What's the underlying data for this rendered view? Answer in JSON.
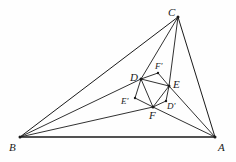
{
  "figure": {
    "background_color": "#fefefe",
    "stroke_color": "#1a1a1a",
    "vertices": {
      "A": {
        "label": "A",
        "x": 215,
        "y": 137,
        "label_x": 218,
        "label_y": 142,
        "size": "major"
      },
      "B": {
        "label": "B",
        "x": 20,
        "y": 137,
        "label_x": 9,
        "label_y": 142,
        "size": "major"
      },
      "C": {
        "label": "C",
        "x": 178,
        "y": 17,
        "label_x": 168,
        "label_y": 7,
        "size": "major"
      },
      "D": {
        "label": "D",
        "x": 141,
        "y": 79,
        "label_x": 130,
        "label_y": 72,
        "size": "major"
      },
      "E": {
        "label": "E",
        "x": 169,
        "y": 86,
        "label_x": 173,
        "label_y": 79,
        "size": "major"
      },
      "F": {
        "label": "F",
        "x": 153,
        "y": 107,
        "label_x": 149,
        "label_y": 110,
        "size": "major"
      },
      "Dp": {
        "label": "D'",
        "x": 166,
        "y": 101,
        "label_x": 167,
        "label_y": 102,
        "size": "minor"
      },
      "Ep": {
        "label": "E'",
        "x": 135,
        "y": 98,
        "label_x": 121,
        "label_y": 97,
        "size": "minor"
      },
      "Fp": {
        "label": "F'",
        "x": 158,
        "y": 73,
        "label_x": 155,
        "label_y": 62,
        "size": "minor"
      }
    },
    "edges": [
      {
        "name": "side-BA",
        "from": "B",
        "to": "A",
        "width": 1.7
      },
      {
        "name": "side-BC",
        "from": "B",
        "to": "C",
        "width": 1.0
      },
      {
        "name": "side-CA",
        "from": "C",
        "to": "A",
        "width": 1.0
      },
      {
        "name": "cevian-B-D",
        "from": "B",
        "to": "D",
        "width": 0.9
      },
      {
        "name": "cevian-B-F",
        "from": "B",
        "to": "F",
        "width": 0.9
      },
      {
        "name": "cevian-A-E",
        "from": "A",
        "to": "E",
        "width": 0.9
      },
      {
        "name": "cevian-A-F",
        "from": "A",
        "to": "F",
        "width": 0.9
      },
      {
        "name": "cevian-C-D",
        "from": "C",
        "to": "D",
        "width": 0.9
      },
      {
        "name": "cevian-C-E",
        "from": "C",
        "to": "E",
        "width": 0.9
      },
      {
        "name": "hexagon-D-Fp",
        "from": "D",
        "to": "Fp",
        "width": 0.9
      },
      {
        "name": "hexagon-Fp-E",
        "from": "Fp",
        "to": "E",
        "width": 0.9
      },
      {
        "name": "hexagon-E-Dp",
        "from": "E",
        "to": "Dp",
        "width": 0.9
      },
      {
        "name": "hexagon-Dp-F",
        "from": "Dp",
        "to": "F",
        "width": 0.9
      },
      {
        "name": "hexagon-F-Ep",
        "from": "F",
        "to": "Ep",
        "width": 0.9
      },
      {
        "name": "hexagon-Ep-D",
        "from": "Ep",
        "to": "D",
        "width": 0.9
      },
      {
        "name": "inner-D-E",
        "from": "D",
        "to": "E",
        "width": 0.9
      },
      {
        "name": "inner-E-F",
        "from": "E",
        "to": "F",
        "width": 0.9
      },
      {
        "name": "inner-F-D",
        "from": "F",
        "to": "D",
        "width": 0.9
      }
    ]
  }
}
